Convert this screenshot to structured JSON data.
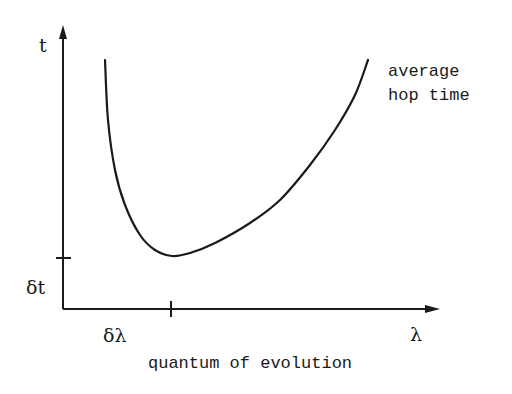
{
  "chart_data": {
    "type": "line",
    "title": "",
    "xlabel": "quantum of evolution",
    "ylabel": "t",
    "x_axis_symbol": "λ",
    "y_axis_symbol": "t",
    "x_tick_labels": [
      "δλ"
    ],
    "y_tick_labels": [
      "δt"
    ],
    "series": [
      {
        "name": "average hop time",
        "description": "U-shaped curve: diverges as λ → small, minimum at λ = δλ with value δt, grows for larger λ",
        "points_px": [
          [
            105,
            60
          ],
          [
            108,
            120
          ],
          [
            115,
            170
          ],
          [
            125,
            205
          ],
          [
            140,
            235
          ],
          [
            155,
            250
          ],
          [
            172,
            256
          ],
          [
            190,
            253
          ],
          [
            215,
            243
          ],
          [
            250,
            223
          ],
          [
            280,
            200
          ],
          [
            310,
            165
          ],
          [
            335,
            130
          ],
          [
            355,
            95
          ],
          [
            368,
            60
          ]
        ]
      }
    ],
    "annotations": [
      "average hop time"
    ],
    "grid": false,
    "legend": "none"
  },
  "labels": {
    "y_axis": "t",
    "x_axis": "λ",
    "y_tick": "δt",
    "x_tick": "δλ",
    "x_title": "quantum of evolution",
    "curve_label_line1": "average",
    "curve_label_line2": "hop time"
  },
  "colors": {
    "ink": "#1a1a1a",
    "background": "#ffffff"
  }
}
